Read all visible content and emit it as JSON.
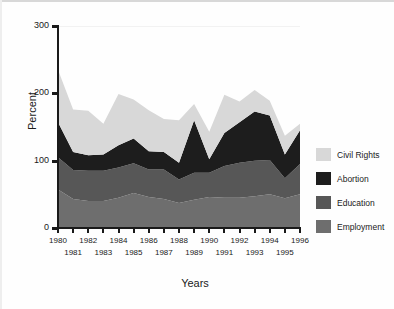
{
  "chart_data": {
    "type": "area",
    "stacked": true,
    "title": "",
    "xlabel": "Years",
    "ylabel": "Percent",
    "ylim": [
      0,
      300
    ],
    "yticks": [
      0,
      100,
      200,
      300
    ],
    "xlim": [
      1980,
      1996
    ],
    "grid": false,
    "legend_position": "right",
    "categories": [
      1980,
      1981,
      1982,
      1983,
      1984,
      1985,
      1986,
      1987,
      1988,
      1989,
      1990,
      1991,
      1992,
      1993,
      1994,
      1995,
      1996
    ],
    "x_tick_labels_top": [
      "1980",
      "1982",
      "1984",
      "1986",
      "1988",
      "1990",
      "1992",
      "1994",
      "1996"
    ],
    "x_tick_labels_bottom": [
      "1981",
      "1983",
      "1985",
      "1987",
      "1989",
      "1991",
      "1993",
      "1995"
    ],
    "series": [
      {
        "name": "Employment",
        "color": "#6e6e6e",
        "values": [
          57,
          43,
          40,
          40,
          45,
          52,
          46,
          43,
          37,
          42,
          46,
          45,
          45,
          47,
          50,
          44,
          50
        ]
      },
      {
        "name": "Education",
        "color": "#575757",
        "values": [
          48,
          43,
          45,
          45,
          45,
          44,
          41,
          44,
          35,
          40,
          36,
          47,
          52,
          53,
          51,
          30,
          45
        ]
      },
      {
        "name": "Abortion",
        "color": "#1d1d1d",
        "values": [
          52,
          27,
          23,
          24,
          33,
          37,
          27,
          26,
          25,
          78,
          20,
          49,
          60,
          73,
          66,
          35,
          50
        ]
      },
      {
        "name": "Civil Rights",
        "color": "#d8d8d8",
        "values": [
          78,
          63,
          66,
          46,
          76,
          58,
          61,
          49,
          63,
          24,
          41,
          57,
          31,
          32,
          22,
          28,
          10
        ]
      }
    ]
  },
  "legend": {
    "items": [
      {
        "label": "Civil Rights",
        "color": "#d8d8d8"
      },
      {
        "label": "Abortion",
        "color": "#1d1d1d"
      },
      {
        "label": "Education",
        "color": "#575757"
      },
      {
        "label": "Employment",
        "color": "#6e6e6e"
      }
    ]
  },
  "axes": {
    "y_title": "Percent",
    "x_title": "Years",
    "y_tick_labels": [
      "300",
      "200",
      "100",
      "0"
    ]
  }
}
